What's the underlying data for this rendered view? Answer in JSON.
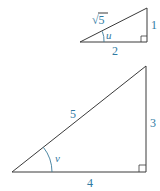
{
  "small_triangle": {
    "hypotenuse_label": "√5",
    "opposite_label": "1",
    "adjacent_label": "2",
    "angle_label": "u"
  },
  "large_triangle": {
    "hypotenuse_label": "5",
    "opposite_label": "3",
    "adjacent_label": "4",
    "angle_label": "v"
  },
  "colors": {
    "lines": "#3a3a3a",
    "labels": "#2f7aa3"
  }
}
